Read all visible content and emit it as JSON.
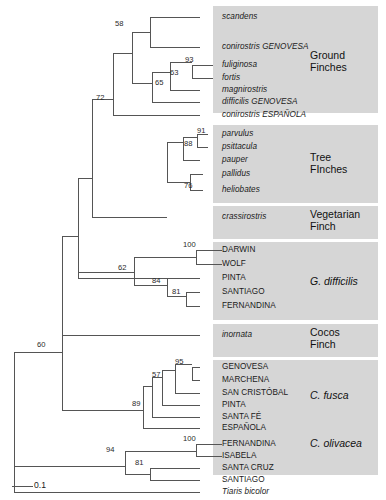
{
  "figure": {
    "width": 386,
    "height": 500,
    "background": "#ffffff",
    "shade_color": "#d6d6d6",
    "line_color": "#555555"
  },
  "scale_bar": {
    "label": "0.1",
    "x1": 12,
    "x2": 33,
    "y": 486
  },
  "groups": [
    {
      "name": "ground-finches",
      "lines": [
        "Ground",
        "Finches"
      ],
      "italic": false,
      "box": {
        "x": 213,
        "y": 6,
        "w": 165,
        "h": 107
      },
      "label_x": 310,
      "label_y": 50
    },
    {
      "name": "tree-finches",
      "lines": [
        "Tree",
        "FInches"
      ],
      "italic": false,
      "box": {
        "x": 213,
        "y": 125,
        "w": 165,
        "h": 78
      },
      "label_x": 310,
      "label_y": 152
    },
    {
      "name": "vegetarian-finch",
      "lines": [
        "Vegetarian",
        "Finch"
      ],
      "italic": false,
      "box": {
        "x": 213,
        "y": 206,
        "w": 165,
        "h": 33
      },
      "label_x": 310,
      "label_y": 209
    },
    {
      "name": "g-difficilis",
      "lines": [
        "G. difficilis"
      ],
      "italic": true,
      "box": {
        "x": 213,
        "y": 242,
        "w": 165,
        "h": 78
      },
      "label_x": 310,
      "label_y": 276
    },
    {
      "name": "cocos-finch",
      "lines": [
        "Cocos",
        "Finch"
      ],
      "italic": false,
      "box": {
        "x": 213,
        "y": 324,
        "w": 165,
        "h": 33
      },
      "label_x": 310,
      "label_y": 327
    },
    {
      "name": "c-fusca",
      "lines": [
        "C. fusca"
      ],
      "italic": true,
      "box": {
        "x": 213,
        "y": 360,
        "w": 165,
        "h": 78
      },
      "label_x": 310,
      "label_y": 390
    },
    {
      "name": "c-olivacea",
      "lines": [
        "C. olivacea"
      ],
      "italic": true,
      "box": {
        "x": 213,
        "y": 417,
        "w": 165,
        "h": 58
      },
      "label_x": 310,
      "label_y": 438
    }
  ],
  "tips": [
    {
      "name": "scandens",
      "label": "scandens",
      "italic": true,
      "x": 222,
      "y": 17,
      "branch_x": 200
    },
    {
      "name": "conirostris-genovesa",
      "label": "conirostris GENOVESA",
      "italic": true,
      "x": 222,
      "y": 47,
      "branch_x": 200
    },
    {
      "name": "fuliginosa",
      "label": "fuliginosa",
      "italic": true,
      "x": 222,
      "y": 65,
      "branch_x": 213
    },
    {
      "name": "fortis",
      "label": "fortis",
      "italic": true,
      "x": 222,
      "y": 78,
      "branch_x": 213
    },
    {
      "name": "magnirostris",
      "label": "magnirostris",
      "italic": true,
      "x": 222,
      "y": 90,
      "branch_x": 200
    },
    {
      "name": "difficilis-genovesa",
      "label": "difficilis GENOVESA",
      "italic": true,
      "x": 222,
      "y": 102,
      "branch_x": 200
    },
    {
      "name": "conirostris-espanola",
      "label": "conirostris ESPAÑOLA",
      "italic": true,
      "x": 222,
      "y": 115,
      "branch_x": 200
    },
    {
      "name": "parvulus",
      "label": "parvulus",
      "italic": true,
      "x": 222,
      "y": 134,
      "branch_x": 208
    },
    {
      "name": "psittacula",
      "label": "psittacula",
      "italic": true,
      "x": 222,
      "y": 147,
      "branch_x": 208
    },
    {
      "name": "pauper",
      "label": "pauper",
      "italic": true,
      "x": 222,
      "y": 160,
      "branch_x": 200
    },
    {
      "name": "pallidus",
      "label": "pallidus",
      "italic": true,
      "x": 222,
      "y": 174,
      "branch_x": 203
    },
    {
      "name": "heliobates",
      "label": "heliobates",
      "italic": true,
      "x": 222,
      "y": 190,
      "branch_x": 203
    },
    {
      "name": "crassirostris",
      "label": "crassirostris",
      "italic": true,
      "x": 222,
      "y": 217,
      "branch_x": 200
    },
    {
      "name": "darwin",
      "label": "DARWIN",
      "italic": false,
      "x": 222,
      "y": 250,
      "branch_x": 200
    },
    {
      "name": "wolf",
      "label": "WOLF",
      "italic": false,
      "x": 222,
      "y": 264,
      "branch_x": 200
    },
    {
      "name": "pinta-difficilis",
      "label": "PINTA",
      "italic": false,
      "x": 222,
      "y": 278,
      "branch_x": 200
    },
    {
      "name": "santiago-difficilis",
      "label": "SANTIAGO",
      "italic": false,
      "x": 222,
      "y": 292,
      "branch_x": 200
    },
    {
      "name": "fernandina-difficilis",
      "label": "FERNANDINA",
      "italic": false,
      "x": 222,
      "y": 306,
      "branch_x": 200
    },
    {
      "name": "inornata",
      "label": "inornata",
      "italic": true,
      "x": 222,
      "y": 335,
      "branch_x": 200
    },
    {
      "name": "genovesa-fusca",
      "label": "GENOVESA",
      "italic": false,
      "x": 222,
      "y": 367,
      "branch_x": 200
    },
    {
      "name": "marchena-fusca",
      "label": "MARCHENA",
      "italic": false,
      "x": 222,
      "y": 380,
      "branch_x": 200
    },
    {
      "name": "san-cristobal-fusca",
      "label": "SAN CRISTÓBAL",
      "italic": false,
      "x": 222,
      "y": 393,
      "branch_x": 200
    },
    {
      "name": "pinta-fusca",
      "label": "PINTA",
      "italic": false,
      "x": 222,
      "y": 405,
      "branch_x": 200
    },
    {
      "name": "santa-fe-fusca",
      "label": "SANTA FÉ",
      "italic": false,
      "x": 222,
      "y": 417,
      "branch_x": 200
    },
    {
      "name": "espanola-fusca",
      "label": "ESPAÑOLA",
      "italic": false,
      "x": 222,
      "y": 428,
      "branch_x": 200
    },
    {
      "name": "fernandina-olivacea",
      "label": "FERNANDINA",
      "italic": false,
      "x": 222,
      "y": 444,
      "branch_x": 208
    },
    {
      "name": "isabela-olivacea",
      "label": "ISABELA",
      "italic": false,
      "x": 222,
      "y": 456,
      "branch_x": 208
    },
    {
      "name": "santa-cruz-olivacea",
      "label": "SANTA CRUZ",
      "italic": false,
      "x": 222,
      "y": 468,
      "branch_x": 200
    },
    {
      "name": "santiago-olivacea",
      "label": "SANTIAGO",
      "italic": false,
      "x": 222,
      "y": 480,
      "branch_x": 200
    },
    {
      "name": "tiaris-bicolor",
      "label": "Tiaris bicolor",
      "italic": true,
      "x": 222,
      "y": 492,
      "branch_x": 200
    }
  ],
  "bootstrap_values": [
    {
      "name": "boot-58",
      "value": "58",
      "x": 115,
      "y": 24
    },
    {
      "name": "boot-93",
      "value": "93",
      "x": 185,
      "y": 60
    },
    {
      "name": "boot-63",
      "value": "63",
      "x": 170,
      "y": 73
    },
    {
      "name": "boot-65",
      "value": "65",
      "x": 155,
      "y": 83
    },
    {
      "name": "boot-72",
      "value": "72",
      "x": 96,
      "y": 98
    },
    {
      "name": "boot-91",
      "value": "91",
      "x": 197,
      "y": 131
    },
    {
      "name": "boot-88",
      "value": "88",
      "x": 184,
      "y": 144
    },
    {
      "name": "boot-76",
      "value": "76",
      "x": 184,
      "y": 186
    },
    {
      "name": "boot-100-difficilis",
      "value": "100",
      "x": 183,
      "y": 245
    },
    {
      "name": "boot-62",
      "value": "62",
      "x": 118,
      "y": 268
    },
    {
      "name": "boot-84",
      "value": "84",
      "x": 152,
      "y": 281
    },
    {
      "name": "boot-81-difficilis",
      "value": "81",
      "x": 172,
      "y": 292
    },
    {
      "name": "boot-60",
      "value": "60",
      "x": 37,
      "y": 345
    },
    {
      "name": "boot-95",
      "value": "95",
      "x": 175,
      "y": 362
    },
    {
      "name": "boot-57",
      "value": "57",
      "x": 152,
      "y": 375
    },
    {
      "name": "boot-89",
      "value": "89",
      "x": 132,
      "y": 404
    },
    {
      "name": "boot-100-olivacea",
      "value": "100",
      "x": 183,
      "y": 439
    },
    {
      "name": "boot-94",
      "value": "94",
      "x": 106,
      "y": 450
    },
    {
      "name": "boot-81-olivacea",
      "value": "81",
      "x": 135,
      "y": 463
    }
  ],
  "tree_edges": {
    "description": "Phylogenetic tree rectangular cladogram edges",
    "segments": [
      {
        "id": "root-v",
        "type": "v",
        "x": 14,
        "y1": 352,
        "y2": 466
      },
      {
        "id": "root-to-outgroup",
        "type": "h",
        "y": 492,
        "x1": 14,
        "x2": 200
      },
      {
        "id": "root-lower-v",
        "type": "v",
        "x": 14,
        "y1": 466,
        "y2": 492
      },
      {
        "id": "n60-h",
        "type": "h",
        "y": 352,
        "x1": 14,
        "x2": 62
      },
      {
        "id": "n60-v",
        "type": "v",
        "x": 62,
        "y1": 236,
        "y2": 410
      },
      {
        "id": "n60-to-89",
        "type": "h",
        "y": 410,
        "x1": 62,
        "x2": 143
      },
      {
        "id": "upper-h",
        "type": "h",
        "y": 236,
        "x1": 62,
        "x2": 78
      },
      {
        "id": "upper-v",
        "type": "v",
        "x": 78,
        "y1": 178,
        "y2": 278
      },
      {
        "id": "crassirostris-h",
        "type": "h",
        "y": 278,
        "x1": 78,
        "x2": 200
      },
      {
        "id": "ground-tree-h",
        "type": "h",
        "y": 178,
        "x1": 78,
        "x2": 92
      },
      {
        "id": "ground-tree-v",
        "type": "v",
        "x": 92,
        "y1": 99,
        "y2": 217
      },
      {
        "id": "treefinch-h",
        "type": "h",
        "y": 217,
        "x1": 92,
        "x2": 167
      },
      {
        "id": "n72-h",
        "type": "h",
        "y": 99,
        "x1": 92,
        "x2": 113
      },
      {
        "id": "n72-v",
        "type": "v",
        "x": 113,
        "y1": 53,
        "y2": 115
      },
      {
        "id": "conirostris-esp-h",
        "type": "h",
        "y": 115,
        "x1": 113,
        "x2": 200
      },
      {
        "id": "n58-65-h",
        "type": "h",
        "y": 53,
        "x1": 113,
        "x2": 132
      },
      {
        "id": "n58-65-v",
        "type": "v",
        "x": 132,
        "y1": 32,
        "y2": 83
      },
      {
        "id": "n58-h",
        "type": "h",
        "y": 32,
        "x1": 132,
        "x2": 150
      },
      {
        "id": "n58-v",
        "type": "v",
        "x": 150,
        "y1": 17,
        "y2": 47
      },
      {
        "id": "scandens-h",
        "type": "h",
        "y": 17,
        "x1": 150,
        "x2": 200
      },
      {
        "id": "conirostris-gen-h",
        "type": "h",
        "y": 47,
        "x1": 150,
        "x2": 200
      },
      {
        "id": "n65-h",
        "type": "h",
        "y": 83,
        "x1": 132,
        "x2": 152
      },
      {
        "id": "n65-v",
        "type": "v",
        "x": 152,
        "y1": 72,
        "y2": 102
      },
      {
        "id": "difficilis-gen-h",
        "type": "h",
        "y": 102,
        "x1": 152,
        "x2": 200
      },
      {
        "id": "n63-h",
        "type": "h",
        "y": 72,
        "x1": 152,
        "x2": 170
      },
      {
        "id": "n63-v",
        "type": "v",
        "x": 170,
        "y1": 62,
        "y2": 90
      },
      {
        "id": "magnirostris-h",
        "type": "h",
        "y": 90,
        "x1": 170,
        "x2": 200
      },
      {
        "id": "n93-h",
        "type": "h",
        "y": 62,
        "x1": 170,
        "x2": 192
      },
      {
        "id": "n93-v",
        "type": "v",
        "x": 192,
        "y1": 65,
        "y2": 78
      },
      {
        "id": "fuliginosa-h",
        "type": "h",
        "y": 65,
        "x1": 192,
        "x2": 213
      },
      {
        "id": "fortis-h",
        "type": "h",
        "y": 78,
        "x1": 192,
        "x2": 213
      },
      {
        "id": "n88-v",
        "type": "v",
        "x": 167,
        "y1": 142,
        "y2": 182
      },
      {
        "id": "n88-h",
        "type": "h",
        "y": 142,
        "x1": 167,
        "x2": 183
      },
      {
        "id": "n88-in-v",
        "type": "v",
        "x": 183,
        "y1": 137,
        "y2": 160
      },
      {
        "id": "pauper-h",
        "type": "h",
        "y": 160,
        "x1": 183,
        "x2": 200
      },
      {
        "id": "n91-h",
        "type": "h",
        "y": 137,
        "x1": 183,
        "x2": 197
      },
      {
        "id": "n91-v",
        "type": "v",
        "x": 197,
        "y1": 134,
        "y2": 147
      },
      {
        "id": "parvulus-h",
        "type": "h",
        "y": 134,
        "x1": 197,
        "x2": 208
      },
      {
        "id": "psittacula-h",
        "type": "h",
        "y": 147,
        "x1": 197,
        "x2": 208
      },
      {
        "id": "n76-h",
        "type": "h",
        "y": 182,
        "x1": 167,
        "x2": 190
      },
      {
        "id": "n76-v",
        "type": "v",
        "x": 190,
        "y1": 174,
        "y2": 190
      },
      {
        "id": "pallidus-h",
        "type": "h",
        "y": 174,
        "x1": 190,
        "x2": 203
      },
      {
        "id": "heliobates-h",
        "type": "h",
        "y": 190,
        "x1": 190,
        "x2": 203
      },
      {
        "id": "n62-h",
        "type": "h",
        "y": 272,
        "x1": 78,
        "x2": 134
      },
      {
        "id": "n62-v",
        "type": "v",
        "x": 134,
        "y1": 257,
        "y2": 285
      },
      {
        "id": "n100d-h",
        "type": "h",
        "y": 257,
        "x1": 134,
        "x2": 196
      },
      {
        "id": "n100d-v",
        "type": "v",
        "x": 196,
        "y1": 250,
        "y2": 264
      },
      {
        "id": "darwin-h",
        "type": "h",
        "y": 250,
        "x1": 196,
        "x2": 222
      },
      {
        "id": "wolf-h",
        "type": "h",
        "y": 264,
        "x1": 196,
        "x2": 222
      },
      {
        "id": "n84-h",
        "type": "h",
        "y": 285,
        "x1": 134,
        "x2": 167
      },
      {
        "id": "n84-v",
        "type": "v",
        "x": 167,
        "y1": 278,
        "y2": 296
      },
      {
        "id": "pinta-d-h",
        "type": "h",
        "y": 278,
        "x1": 167,
        "x2": 200
      },
      {
        "id": "n81d-h",
        "type": "h",
        "y": 296,
        "x1": 167,
        "x2": 186
      },
      {
        "id": "n81d-v",
        "type": "v",
        "x": 186,
        "y1": 292,
        "y2": 306
      },
      {
        "id": "santiago-d-h",
        "type": "h",
        "y": 292,
        "x1": 186,
        "x2": 200
      },
      {
        "id": "fernandina-d-h",
        "type": "h",
        "y": 306,
        "x1": 186,
        "x2": 200
      },
      {
        "id": "inornata-h",
        "type": "h",
        "y": 335,
        "x1": 62,
        "x2": 200
      },
      {
        "id": "n89-v",
        "type": "v",
        "x": 143,
        "y1": 386,
        "y2": 428
      },
      {
        "id": "espanola-f-h",
        "type": "h",
        "y": 428,
        "x1": 143,
        "x2": 200
      },
      {
        "id": "n89-up-h",
        "type": "h",
        "y": 386,
        "x1": 143,
        "x2": 152
      },
      {
        "id": "n89-up-v",
        "type": "v",
        "x": 152,
        "y1": 377,
        "y2": 417
      },
      {
        "id": "santa-fe-h",
        "type": "h",
        "y": 417,
        "x1": 152,
        "x2": 200
      },
      {
        "id": "n57-h",
        "type": "h",
        "y": 377,
        "x1": 152,
        "x2": 162
      },
      {
        "id": "n57-v",
        "type": "v",
        "x": 162,
        "y1": 370,
        "y2": 405
      },
      {
        "id": "pinta-f-h",
        "type": "h",
        "y": 405,
        "x1": 162,
        "x2": 200
      },
      {
        "id": "n57-in-h",
        "type": "h",
        "y": 370,
        "x1": 162,
        "x2": 175
      },
      {
        "id": "n57-in-v",
        "type": "v",
        "x": 175,
        "y1": 364,
        "y2": 393
      },
      {
        "id": "san-cristobal-h",
        "type": "h",
        "y": 393,
        "x1": 175,
        "x2": 200
      },
      {
        "id": "n95-h",
        "type": "h",
        "y": 364,
        "x1": 175,
        "x2": 192
      },
      {
        "id": "n95-v",
        "type": "v",
        "x": 192,
        "y1": 367,
        "y2": 380
      },
      {
        "id": "genovesa-f-h",
        "type": "h",
        "y": 367,
        "x1": 192,
        "x2": 200
      },
      {
        "id": "marchena-f-h",
        "type": "h",
        "y": 380,
        "x1": 192,
        "x2": 200
      },
      {
        "id": "n94-h",
        "type": "h",
        "y": 466,
        "x1": 14,
        "x2": 125
      },
      {
        "id": "n94-v",
        "type": "v",
        "x": 125,
        "y1": 451,
        "y2": 474
      },
      {
        "id": "n100o-h",
        "type": "h",
        "y": 451,
        "x1": 125,
        "x2": 196
      },
      {
        "id": "n100o-v",
        "type": "v",
        "x": 196,
        "y1": 444,
        "y2": 456
      },
      {
        "id": "fernandina-o-h",
        "type": "h",
        "y": 444,
        "x1": 196,
        "x2": 222
      },
      {
        "id": "isabela-o-h",
        "type": "h",
        "y": 456,
        "x1": 196,
        "x2": 222
      },
      {
        "id": "n81o-h",
        "type": "h",
        "y": 474,
        "x1": 125,
        "x2": 150
      },
      {
        "id": "n81o-v",
        "type": "v",
        "x": 150,
        "y1": 468,
        "y2": 480
      },
      {
        "id": "santa-cruz-o-h",
        "type": "h",
        "y": 468,
        "x1": 150,
        "x2": 200
      },
      {
        "id": "santiago-o-h",
        "type": "h",
        "y": 480,
        "x1": 150,
        "x2": 200
      }
    ]
  }
}
